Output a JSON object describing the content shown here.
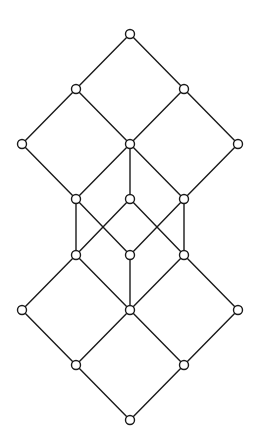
{
  "diagram": {
    "type": "hasse-diagram",
    "width": 260,
    "height": 446,
    "colors": {
      "stroke": "#1a1a1a",
      "node_fill": "#ffffff",
      "background": "#ffffff"
    },
    "node_radius": 4.5,
    "nodes": [
      {
        "id": "n0",
        "x": 130,
        "y": 34
      },
      {
        "id": "n1",
        "x": 76,
        "y": 89
      },
      {
        "id": "n2",
        "x": 184,
        "y": 89
      },
      {
        "id": "n3",
        "x": 22,
        "y": 144
      },
      {
        "id": "n4",
        "x": 130,
        "y": 144
      },
      {
        "id": "n5",
        "x": 238,
        "y": 144
      },
      {
        "id": "n6",
        "x": 76,
        "y": 199
      },
      {
        "id": "n7",
        "x": 130,
        "y": 199
      },
      {
        "id": "n8",
        "x": 184,
        "y": 199
      },
      {
        "id": "n9",
        "x": 76,
        "y": 255
      },
      {
        "id": "n10",
        "x": 130,
        "y": 255
      },
      {
        "id": "n11",
        "x": 184,
        "y": 255
      },
      {
        "id": "n12",
        "x": 22,
        "y": 310
      },
      {
        "id": "n13",
        "x": 130,
        "y": 310
      },
      {
        "id": "n14",
        "x": 238,
        "y": 310
      },
      {
        "id": "n15",
        "x": 76,
        "y": 365
      },
      {
        "id": "n16",
        "x": 184,
        "y": 365
      },
      {
        "id": "n17",
        "x": 130,
        "y": 420
      }
    ],
    "edges": [
      [
        "n0",
        "n1"
      ],
      [
        "n0",
        "n2"
      ],
      [
        "n1",
        "n3"
      ],
      [
        "n1",
        "n4"
      ],
      [
        "n2",
        "n4"
      ],
      [
        "n2",
        "n5"
      ],
      [
        "n3",
        "n6"
      ],
      [
        "n4",
        "n6"
      ],
      [
        "n4",
        "n7"
      ],
      [
        "n4",
        "n8"
      ],
      [
        "n5",
        "n8"
      ],
      [
        "n6",
        "n9"
      ],
      [
        "n6",
        "n10"
      ],
      [
        "n7",
        "n9"
      ],
      [
        "n7",
        "n11"
      ],
      [
        "n8",
        "n10"
      ],
      [
        "n8",
        "n11"
      ],
      [
        "n9",
        "n12"
      ],
      [
        "n9",
        "n13"
      ],
      [
        "n10",
        "n13"
      ],
      [
        "n11",
        "n13"
      ],
      [
        "n11",
        "n14"
      ],
      [
        "n12",
        "n15"
      ],
      [
        "n13",
        "n15"
      ],
      [
        "n13",
        "n16"
      ],
      [
        "n14",
        "n16"
      ],
      [
        "n15",
        "n17"
      ],
      [
        "n16",
        "n17"
      ]
    ]
  }
}
